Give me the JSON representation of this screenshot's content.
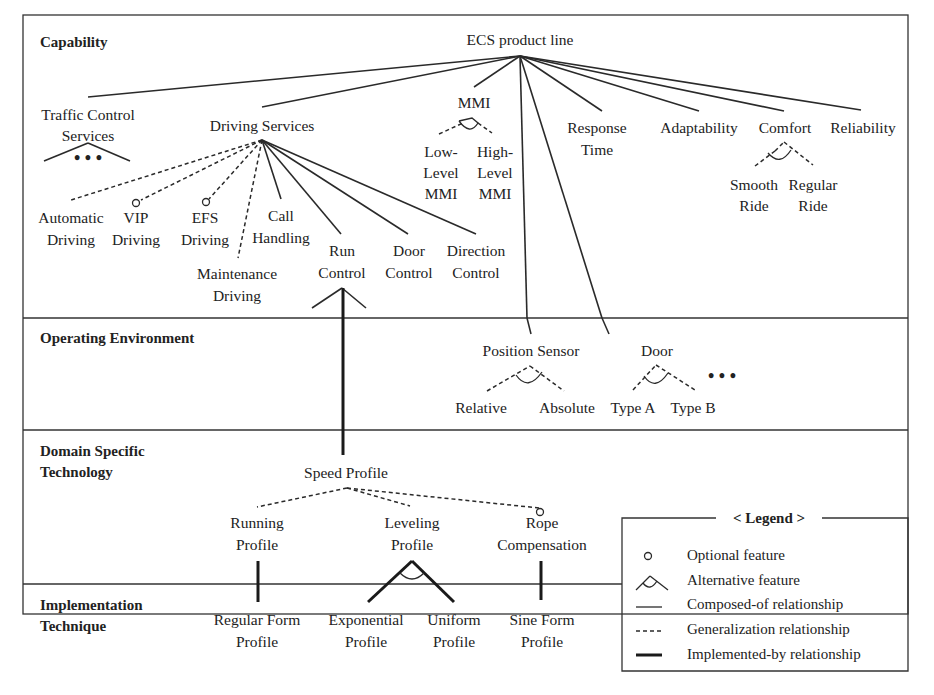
{
  "figure": {
    "bands": [
      {
        "id": "capability",
        "label_lines": [
          "Capability"
        ]
      },
      {
        "id": "operating-environment",
        "label_lines": [
          "Operating Environment"
        ]
      },
      {
        "id": "domain-specific-technology",
        "label_lines": [
          "Domain Specific",
          "Technology"
        ]
      },
      {
        "id": "implementation-technique",
        "label_lines": [
          "Implementation",
          "Technique"
        ]
      }
    ],
    "nodes": {
      "root": {
        "lines": [
          "ECS product line"
        ]
      },
      "traffic_control_services": {
        "lines": [
          "Traffic Control",
          "Services"
        ]
      },
      "driving_services": {
        "lines": [
          "Driving Services"
        ]
      },
      "mmi": {
        "lines": [
          "MMI"
        ]
      },
      "low_level_mmi": {
        "lines": [
          "Low-",
          "Level",
          "MMI"
        ]
      },
      "high_level_mmi": {
        "lines": [
          "High-",
          "Level",
          "MMI"
        ]
      },
      "response_time": {
        "lines": [
          "Response",
          "Time"
        ]
      },
      "adaptability": {
        "lines": [
          "Adaptability"
        ]
      },
      "comfort": {
        "lines": [
          "Comfort"
        ]
      },
      "reliability": {
        "lines": [
          "Reliability"
        ]
      },
      "smooth_ride": {
        "lines": [
          "Smooth",
          "Ride"
        ]
      },
      "regular_ride": {
        "lines": [
          "Regular",
          "Ride"
        ]
      },
      "automatic_driving": {
        "lines": [
          "Automatic",
          "Driving"
        ]
      },
      "vip_driving": {
        "lines": [
          "VIP",
          "Driving"
        ]
      },
      "efs_driving": {
        "lines": [
          "EFS",
          "Driving"
        ]
      },
      "maintenance_driving": {
        "lines": [
          "Maintenance",
          "Driving"
        ]
      },
      "call_handling": {
        "lines": [
          "Call",
          "Handling"
        ]
      },
      "run_control": {
        "lines": [
          "Run",
          "Control"
        ]
      },
      "door_control": {
        "lines": [
          "Door",
          "Control"
        ]
      },
      "direction_control": {
        "lines": [
          "Direction",
          "Control"
        ]
      },
      "position_sensor": {
        "lines": [
          "Position Sensor"
        ]
      },
      "relative": {
        "lines": [
          "Relative"
        ]
      },
      "absolute": {
        "lines": [
          "Absolute"
        ]
      },
      "door": {
        "lines": [
          "Door"
        ]
      },
      "type_a": {
        "lines": [
          "Type A"
        ]
      },
      "type_b": {
        "lines": [
          "Type B"
        ]
      },
      "speed_profile": {
        "lines": [
          "Speed Profile"
        ]
      },
      "running_profile": {
        "lines": [
          "Running",
          "Profile"
        ]
      },
      "leveling_profile": {
        "lines": [
          "Leveling",
          "Profile"
        ]
      },
      "rope_compensation": {
        "lines": [
          "Rope",
          "Compensation"
        ]
      },
      "regular_form_profile": {
        "lines": [
          "Regular Form",
          "Profile"
        ]
      },
      "exponential_profile": {
        "lines": [
          "Exponential",
          "Profile"
        ]
      },
      "uniform_profile": {
        "lines": [
          "Uniform",
          "Profile"
        ]
      },
      "sine_form_profile": {
        "lines": [
          "Sine Form",
          "Profile"
        ]
      }
    },
    "ellipsis": "• • •"
  },
  "legend": {
    "title": "< Legend >",
    "items": [
      {
        "symbol": "optional",
        "label": "Optional feature"
      },
      {
        "symbol": "alternative",
        "label": "Alternative feature"
      },
      {
        "symbol": "composed-of",
        "label": "Composed-of relationship"
      },
      {
        "symbol": "generalization",
        "label": "Generalization relationship"
      },
      {
        "symbol": "implemented-by",
        "label": "Implemented-by relationship"
      }
    ]
  }
}
